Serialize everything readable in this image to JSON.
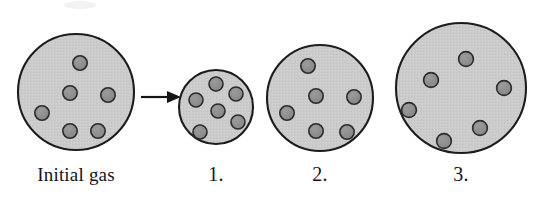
{
  "figure": {
    "title_visible": false,
    "background_color": "#ffffff",
    "width": 541,
    "height": 200
  },
  "colors": {
    "container_fill": "#cbcbcb",
    "container_stroke": "#1c1c1c",
    "particle_fill": "#8d8d8d",
    "particle_stroke": "#2b2b2b",
    "arrow_color": "#141414",
    "label_color": "#15131a"
  },
  "arrow": {
    "name": "process-arrow",
    "x1": 141,
    "y1": 97,
    "x2": 168,
    "y2": 97,
    "head_points": "168,91 180,97 168,103"
  },
  "panels": [
    {
      "id": "initial-gas",
      "label": "Initial gas",
      "label_x": 76,
      "label_y": 181,
      "circle": {
        "cx": 76,
        "cy": 92,
        "r": 58
      },
      "particle_radius": 7.2,
      "particle_count": 6,
      "particles": [
        {
          "cx": 80,
          "cy": 63
        },
        {
          "cx": 70,
          "cy": 93
        },
        {
          "cx": 108,
          "cy": 95
        },
        {
          "cx": 42,
          "cy": 113
        },
        {
          "cx": 70,
          "cy": 131
        },
        {
          "cx": 98,
          "cy": 131
        }
      ]
    },
    {
      "id": "state-1",
      "label": "1.",
      "label_x": 216,
      "label_y": 181,
      "circle": {
        "cx": 216,
        "cy": 107,
        "r": 37
      },
      "particle_radius": 7.0,
      "particle_count": 6,
      "particles": [
        {
          "cx": 216,
          "cy": 84
        },
        {
          "cx": 236,
          "cy": 94
        },
        {
          "cx": 196,
          "cy": 100
        },
        {
          "cx": 218,
          "cy": 111
        },
        {
          "cx": 238,
          "cy": 122
        },
        {
          "cx": 200,
          "cy": 132
        }
      ]
    },
    {
      "id": "state-2",
      "label": "2.",
      "label_x": 320,
      "label_y": 181,
      "circle": {
        "cx": 320,
        "cy": 98,
        "r": 53
      },
      "particle_radius": 7.2,
      "particle_count": 6,
      "particles": [
        {
          "cx": 308,
          "cy": 66
        },
        {
          "cx": 316,
          "cy": 96
        },
        {
          "cx": 354,
          "cy": 97
        },
        {
          "cx": 287,
          "cy": 113
        },
        {
          "cx": 316,
          "cy": 131
        },
        {
          "cx": 347,
          "cy": 132
        }
      ]
    },
    {
      "id": "state-3",
      "label": "3.",
      "label_x": 461,
      "label_y": 181,
      "circle": {
        "cx": 461,
        "cy": 88,
        "r": 65
      },
      "particle_radius": 7.4,
      "particle_count": 6,
      "particles": [
        {
          "cx": 466,
          "cy": 59
        },
        {
          "cx": 431,
          "cy": 80
        },
        {
          "cx": 504,
          "cy": 88
        },
        {
          "cx": 409,
          "cy": 110
        },
        {
          "cx": 480,
          "cy": 128
        },
        {
          "cx": 444,
          "cy": 141
        }
      ]
    }
  ]
}
